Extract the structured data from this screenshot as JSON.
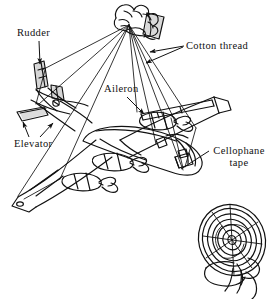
{
  "figure": {
    "background_color": "#ffffff",
    "ink_color": "#111111",
    "shade_color": "#d8d8d8"
  },
  "labels": {
    "rudder": "Rudder",
    "cotton_thread": "Cotton thread",
    "aileron": "Aileron",
    "elevator": "Elevator",
    "cellophane_tape_line1": "Cellophane",
    "cellophane_tape_line2": "tape"
  },
  "objects": {
    "hand": "hand-holding-threads",
    "airplane": "model-airplane",
    "fan": "electric-fan",
    "threads": "cotton-threads",
    "tape_patch": "cellophane-tape-patch"
  },
  "annotations": [
    {
      "name": "rudder",
      "label": "Rudder",
      "arrow_from": [
        38,
        40
      ],
      "arrow_to": [
        40,
        66
      ]
    },
    {
      "name": "cotton-thread",
      "label": "Cotton thread",
      "arrow_from": [
        184,
        46
      ],
      "arrow_to": [
        148,
        52
      ]
    },
    {
      "name": "cotton-thread-2",
      "label": "Cotton thread",
      "arrow_from": [
        184,
        46
      ],
      "arrow_to": [
        143,
        62
      ]
    },
    {
      "name": "aileron",
      "label": "Aileron",
      "arrow_from": [
        127,
        97
      ],
      "arrow_to": [
        143,
        113
      ]
    },
    {
      "name": "elevator",
      "label": "Elevator",
      "arrow_from": [
        28,
        137
      ],
      "arrow_to": [
        23,
        121
      ]
    },
    {
      "name": "elevator-2",
      "label": "Elevator",
      "arrow_from": [
        38,
        137
      ],
      "arrow_to": [
        52,
        122
      ]
    },
    {
      "name": "cellophane-tape",
      "label": "Cellophane tape",
      "arrow_from": [
        210,
        150
      ],
      "arrow_to": [
        182,
        168
      ]
    }
  ]
}
